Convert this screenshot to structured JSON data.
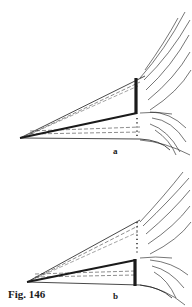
{
  "figure": {
    "caption": "Fig. 146",
    "panels": [
      {
        "label": "a",
        "description": "wedge with thick line along lower inner edge and thick vertical bar above it; dotted line below"
      },
      {
        "label": "b",
        "description": "wedge with thick line along lower inner edge and thick vertical bar below it; dotted line above"
      }
    ]
  },
  "colors": {
    "ink": "#1a1a1a",
    "background": "#ffffff"
  }
}
